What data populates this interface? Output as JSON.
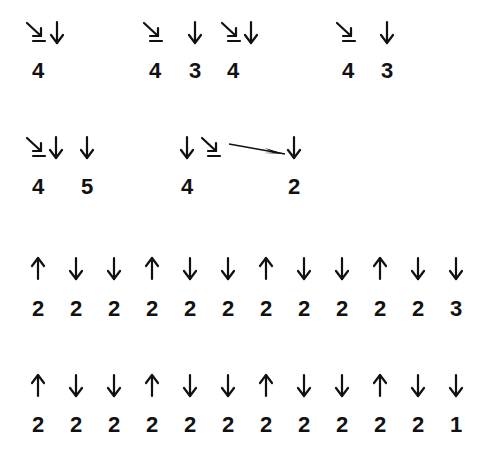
{
  "colors": {
    "ink": "#111111",
    "background": "#ffffff"
  },
  "rows": [
    {
      "id": "row-1",
      "symbols": [
        {
          "type": "diag-bar",
          "x": 38,
          "y": 22
        },
        {
          "type": "down",
          "x": 57,
          "y": 22
        },
        {
          "type": "diag-bar",
          "x": 155,
          "y": 22
        },
        {
          "type": "down",
          "x": 195,
          "y": 22
        },
        {
          "type": "diag-bar",
          "x": 233,
          "y": 22
        },
        {
          "type": "down",
          "x": 251,
          "y": 22
        },
        {
          "type": "diag-bar",
          "x": 348,
          "y": 22
        },
        {
          "type": "down",
          "x": 387,
          "y": 22
        }
      ],
      "numbers": [
        {
          "value": "4",
          "x": 38,
          "y": 60
        },
        {
          "value": "4",
          "x": 155,
          "y": 60
        },
        {
          "value": "3",
          "x": 195,
          "y": 60
        },
        {
          "value": "4",
          "x": 233,
          "y": 60
        },
        {
          "value": "4",
          "x": 348,
          "y": 60
        },
        {
          "value": "3",
          "x": 387,
          "y": 60
        }
      ]
    },
    {
      "id": "row-2",
      "symbols": [
        {
          "type": "diag-bar",
          "x": 38,
          "y": 137
        },
        {
          "type": "down",
          "x": 56,
          "y": 137
        },
        {
          "type": "down",
          "x": 87,
          "y": 137
        },
        {
          "type": "down",
          "x": 187,
          "y": 137
        },
        {
          "type": "diag-bar",
          "x": 213,
          "y": 137
        },
        {
          "type": "long-arrow",
          "x1": 229,
          "y1": 144,
          "x2": 285,
          "y2": 154
        },
        {
          "type": "down",
          "x": 294,
          "y": 137
        }
      ],
      "numbers": [
        {
          "value": "4",
          "x": 38,
          "y": 176
        },
        {
          "value": "5",
          "x": 87,
          "y": 176
        },
        {
          "value": "4",
          "x": 187,
          "y": 176
        },
        {
          "value": "2",
          "x": 294,
          "y": 176
        }
      ]
    },
    {
      "id": "row-3",
      "arrows": [
        "up",
        "down",
        "down",
        "up",
        "down",
        "down",
        "up",
        "down",
        "down",
        "up",
        "down",
        "down"
      ],
      "values": [
        "2",
        "2",
        "2",
        "2",
        "2",
        "2",
        "2",
        "2",
        "2",
        "2",
        "2",
        "3"
      ],
      "arrow_y": 258,
      "number_y": 298
    },
    {
      "id": "row-4",
      "arrows": [
        "up",
        "down",
        "down",
        "up",
        "down",
        "down",
        "up",
        "down",
        "down",
        "up",
        "down",
        "down"
      ],
      "values": [
        "2",
        "2",
        "2",
        "2",
        "2",
        "2",
        "2",
        "2",
        "2",
        "2",
        "2",
        "1"
      ],
      "arrow_y": 375,
      "number_y": 414
    }
  ],
  "grid_columns_x": [
    38,
    76,
    114,
    152,
    190,
    228,
    266,
    304,
    342,
    380,
    418,
    456
  ]
}
